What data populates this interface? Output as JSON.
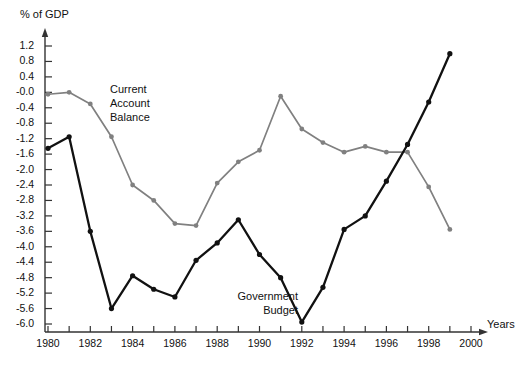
{
  "chart_data": {
    "type": "line",
    "title": "",
    "subtitle": "",
    "ylabel": "% of GDP",
    "xlabel": "Years",
    "grid": false,
    "legend_position": "inline-annotations",
    "x": [
      1980,
      1981,
      1982,
      1983,
      1984,
      1985,
      1986,
      1987,
      1988,
      1989,
      1990,
      1991,
      1992,
      1993,
      1994,
      1995,
      1996,
      1997,
      1998,
      1999
    ],
    "xlim": [
      1979.4,
      2000.6
    ],
    "ylim": [
      -6.2,
      1.45
    ],
    "y_ticks": [
      1.2,
      0.8,
      0.4,
      -0.0,
      -0.4,
      -0.8,
      -1.2,
      -1.6,
      -2.0,
      -2.4,
      -2.8,
      -3.2,
      -3.6,
      -4.0,
      -4.4,
      -4.8,
      -5.2,
      -5.6,
      -6.0
    ],
    "y_tick_labels": [
      "1.2",
      "0.8",
      "0.4",
      "-0.0",
      "-0.4",
      "-0.8",
      "-1.2",
      "-1.6",
      "-2.0",
      "-2.4",
      "-2.8",
      "-3.2",
      "-3.6",
      "-4.0",
      "-4.4",
      "-4.8",
      "-5.2",
      "-5.6",
      "-6.0"
    ],
    "x_ticks": [
      1980,
      1981,
      1982,
      1983,
      1984,
      1985,
      1986,
      1987,
      1988,
      1989,
      1990,
      1991,
      1992,
      1993,
      1994,
      1995,
      1996,
      1997,
      1998,
      1999,
      2000
    ],
    "x_tick_labels": [
      "1980",
      "",
      "1982",
      "",
      "1984",
      "",
      "1986",
      "",
      "1988",
      "",
      "1990",
      "",
      "1992",
      "",
      "1994",
      "",
      "1996",
      "",
      "1998",
      "",
      "2000"
    ],
    "series": [
      {
        "name": "Current Account Balance",
        "color": "#808080",
        "values": [
          -0.05,
          -0.0,
          -0.3,
          -1.15,
          -2.4,
          -2.8,
          -3.4,
          -3.45,
          -2.35,
          -1.8,
          -1.5,
          -0.1,
          -0.95,
          -1.3,
          -1.55,
          -1.4,
          -1.55,
          -1.55,
          -2.45,
          -3.55
        ]
      },
      {
        "name": "Government Budget",
        "color": "#111111",
        "values": [
          -1.45,
          -1.15,
          -3.6,
          -5.6,
          -4.75,
          -5.1,
          -5.3,
          -4.35,
          -3.9,
          -3.3,
          -4.2,
          -4.8,
          -5.95,
          -5.05,
          -3.55,
          -3.2,
          -2.3,
          -1.35,
          -0.25,
          1.0
        ]
      }
    ],
    "annotations": [
      {
        "name": "current-account-balance",
        "text": "Current\nAccount\nBalance"
      },
      {
        "name": "government-budget",
        "text": "Government\nBudget"
      }
    ]
  },
  "axes": {
    "y_title": "% of GDP",
    "x_title": "Years"
  },
  "annotations": {
    "current_account": "Current\nAccount\nBalance",
    "government_budget": "Government\nBudget"
  },
  "colors": {
    "current_account": "#808080",
    "government_budget": "#111111",
    "axis": "#333333",
    "background": "#ffffff"
  }
}
